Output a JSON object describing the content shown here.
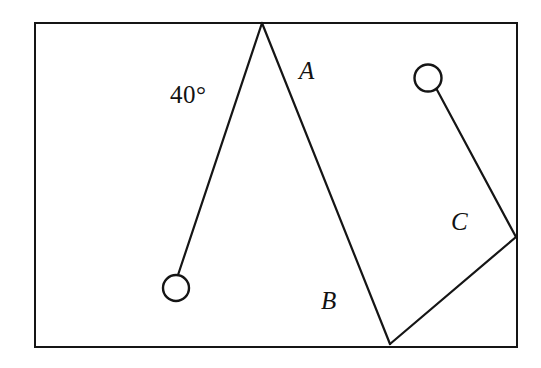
{
  "figure": {
    "name": "two-pendulum-geometry-figure",
    "background_color": "#ffffff",
    "stroke_color": "#151515",
    "frame": {
      "name": "outer-rectangle",
      "x": 35,
      "y": 23,
      "width": 482,
      "height": 324,
      "stroke_width": 2.6
    },
    "labels": {
      "angle": "40°",
      "string_a": "A",
      "string_b": "B",
      "string_c": "C"
    },
    "pivots": [
      {
        "name": "apex-pivot",
        "x": 262,
        "y": 23
      },
      {
        "name": "lower-pivot",
        "x": 390,
        "y": 344
      },
      {
        "name": "right-pivot",
        "x": 516,
        "y": 237
      }
    ],
    "bobs": [
      {
        "name": "left-bob",
        "cx": 176,
        "cy": 288,
        "r": 13,
        "stroke_width": 2.4
      },
      {
        "name": "right-bob",
        "cx": 428,
        "cy": 78,
        "r": 13.5,
        "stroke_width": 2.4
      }
    ],
    "strings": [
      {
        "name": "left-string",
        "label": "40°",
        "x1": 262,
        "y1": 23,
        "x2": 178,
        "y2": 275,
        "stroke_width": 2.2
      },
      {
        "name": "string-ab",
        "label": "A / B",
        "x1": 262,
        "y1": 23,
        "x2": 390,
        "y2": 344,
        "stroke_width": 2.2
      },
      {
        "name": "string-c-upper",
        "label": "C",
        "x1": 436,
        "y1": 88,
        "x2": 516,
        "y2": 237,
        "stroke_width": 2.2
      },
      {
        "name": "string-c-lower",
        "label": "",
        "x1": 516,
        "y1": 237,
        "x2": 390,
        "y2": 344,
        "stroke_width": 2.2
      }
    ]
  }
}
